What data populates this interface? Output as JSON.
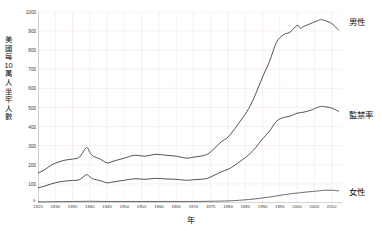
{
  "chart_data": {
    "type": "line",
    "title": "",
    "xlabel": "年",
    "ylabel": "美國每10萬人坐牢人數",
    "xlim": [
      1925,
      2013
    ],
    "ylim": [
      0,
      1000
    ],
    "grid": true,
    "legend_position": "right-inline",
    "y_ticks": [
      100,
      200,
      300,
      400,
      500,
      600,
      700,
      800,
      900,
      1000
    ],
    "y_tick_labels": [
      "100",
      "200",
      "300",
      "400",
      "500",
      "600",
      "700",
      "800",
      "900",
      "1000"
    ],
    "origin_label": "0",
    "x_ticks": [
      1925,
      1930,
      1935,
      1940,
      1945,
      1950,
      1955,
      1960,
      1965,
      1970,
      1975,
      1980,
      1985,
      1990,
      1995,
      2000,
      2005,
      2010
    ],
    "x_tick_labels": [
      "1925",
      "1930",
      "1935",
      "1940",
      "1945",
      "1950",
      "1955",
      "1960",
      "1965",
      "1970",
      "1975",
      "1980",
      "1985",
      "1990",
      "1995",
      "2000",
      "2005",
      "2010"
    ],
    "series": [
      {
        "name": "男性",
        "color": "#404040",
        "x": [
          1925,
          1927,
          1929,
          1931,
          1933,
          1935,
          1937,
          1939,
          1940,
          1941,
          1943,
          1945,
          1947,
          1950,
          1953,
          1956,
          1959,
          1962,
          1965,
          1968,
          1970,
          1972,
          1974,
          1976,
          1978,
          1980,
          1982,
          1984,
          1986,
          1988,
          1990,
          1992,
          1994,
          1996,
          1998,
          2000,
          2001,
          2002,
          2004,
          2006,
          2007,
          2008,
          2010,
          2012
        ],
        "values": [
          157,
          175,
          200,
          215,
          225,
          230,
          240,
          290,
          265,
          245,
          230,
          210,
          220,
          235,
          250,
          245,
          255,
          250,
          245,
          235,
          240,
          245,
          255,
          285,
          320,
          345,
          390,
          440,
          495,
          570,
          660,
          740,
          840,
          880,
          895,
          930,
          915,
          925,
          940,
          955,
          960,
          955,
          940,
          905
        ]
      },
      {
        "name": "監禁率",
        "color": "#404040",
        "x": [
          1925,
          1927,
          1929,
          1931,
          1933,
          1935,
          1937,
          1939,
          1940,
          1941,
          1943,
          1945,
          1947,
          1950,
          1953,
          1956,
          1959,
          1962,
          1965,
          1968,
          1970,
          1972,
          1974,
          1976,
          1978,
          1980,
          1982,
          1984,
          1986,
          1988,
          1990,
          1992,
          1994,
          1996,
          1998,
          2000,
          2002,
          2004,
          2006,
          2007,
          2008,
          2010,
          2012
        ],
        "values": [
          79,
          89,
          101,
          110,
          115,
          118,
          122,
          148,
          137,
          126,
          117,
          106,
          111,
          119,
          127,
          124,
          129,
          126,
          124,
          119,
          122,
          124,
          129,
          145,
          163,
          176,
          198,
          224,
          252,
          290,
          336,
          376,
          427,
          447,
          455,
          470,
          476,
          486,
          501,
          506,
          504,
          497,
          480
        ]
      },
      {
        "name": "女性",
        "color": "#5a5a5a",
        "x": [
          1925,
          1930,
          1935,
          1940,
          1945,
          1950,
          1955,
          1960,
          1965,
          1970,
          1975,
          1980,
          1983,
          1986,
          1989,
          1992,
          1995,
          1998,
          2000,
          2003,
          2006,
          2008,
          2010,
          2012
        ],
        "values": [
          6,
          7,
          8,
          9,
          8,
          8,
          8,
          8,
          8,
          8,
          9,
          11,
          14,
          18,
          24,
          31,
          40,
          48,
          52,
          58,
          63,
          67,
          67,
          63
        ]
      }
    ],
    "series_labels": {
      "male": "男性",
      "rate": "監禁率",
      "female": "女性"
    },
    "colors": {
      "line": "#404040",
      "grid": "#f2dede",
      "axis": "#888888",
      "text": "#1a1a1a",
      "background": "#ffffff"
    }
  }
}
